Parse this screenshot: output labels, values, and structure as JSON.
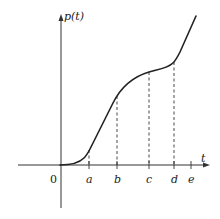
{
  "figure": {
    "y_axis_label": "p(t)",
    "x_axis_label": "t",
    "origin_label": "0",
    "ticks": [
      {
        "label": "a",
        "x": 89,
        "curve_y": 150
      },
      {
        "label": "b",
        "x": 117,
        "curve_y": 96
      },
      {
        "label": "c",
        "x": 149,
        "curve_y": 72
      },
      {
        "label": "d",
        "x": 174,
        "curve_y": 62
      },
      {
        "label": "e",
        "x": 191,
        "curve_y": null
      }
    ]
  }
}
